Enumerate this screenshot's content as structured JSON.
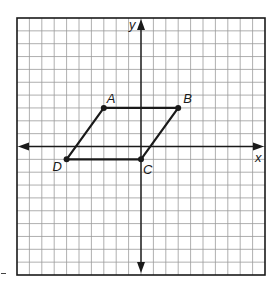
{
  "diagram": {
    "type": "coordinate-plane-parallelogram",
    "grid": {
      "x_range": [
        -10,
        10
      ],
      "y_range": [
        -10,
        10
      ],
      "cell_count_x": 20,
      "cell_count_y": 20,
      "grid_color": "#9a9a9a",
      "border_color": "#1a1a1a"
    },
    "axes": {
      "x_label": "x",
      "y_label": "y",
      "color": "#1a1a1a"
    },
    "points": [
      {
        "label": "A",
        "x": -3,
        "y": 3
      },
      {
        "label": "B",
        "x": 3,
        "y": 3
      },
      {
        "label": "C",
        "x": 0,
        "y": -1
      },
      {
        "label": "D",
        "x": -6,
        "y": -1
      }
    ],
    "polygon": [
      "A",
      "B",
      "C",
      "D"
    ],
    "stroke_color": "#1a1a1a"
  }
}
